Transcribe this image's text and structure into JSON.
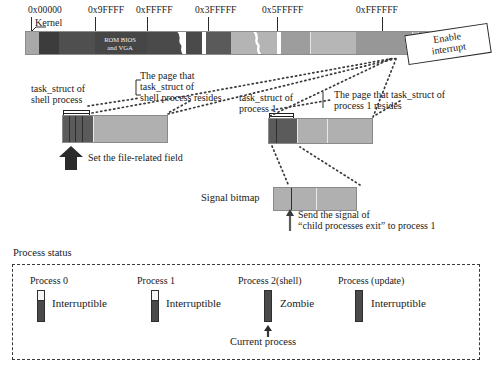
{
  "diagram": {
    "title_process_status": "Process status",
    "memory_map": {
      "addresses": [
        "0x00000",
        "0x9FFFF",
        "0xFFFFF",
        "0x3FFFFF",
        "0x5FFFFF",
        "0xFFFFFF"
      ],
      "kernel_label": "Kernel",
      "rom_label_line1": "ROM BIOS",
      "rom_label_line2": "and VGA"
    },
    "callout": {
      "enable_interrupt_line1": "Enable",
      "enable_interrupt_line2": "interrupt"
    },
    "shell": {
      "task_struct_line1": "task_struct of",
      "task_struct_line2": "shell process",
      "page_line1": "The page that",
      "page_line2": "task_struct of",
      "page_line3": "shell process resides",
      "action": "Set the file-related field"
    },
    "process1": {
      "task_struct_line1": "task_struct of",
      "task_struct_line2": "process 1",
      "page_line1": "The page that task_struct of",
      "page_line2": "process 1 resides"
    },
    "signal": {
      "bitmap_label": "Signal bitmap",
      "action_line1": "Send the signal of",
      "action_line2": "“child processes exit” to process 1"
    },
    "processes": [
      {
        "name": "Process 0",
        "state": "Interruptible",
        "bar": "partial"
      },
      {
        "name": "Process 1",
        "state": "Interruptible",
        "bar": "partial"
      },
      {
        "name": "Process 2(shell)",
        "state": "Zombie",
        "bar": "full",
        "note": "Current process"
      },
      {
        "name": "Process (update)",
        "state": "Interruptible",
        "bar": "full"
      }
    ],
    "colors": {
      "bar_light": "#b9b9b9",
      "bar_mid": "#9a9a9a",
      "bar_dark": "#4f4f4f",
      "bar_darker": "#3c3c3c",
      "outline": "#2b2b2b",
      "page_fill": "#b0b0b0",
      "page_dark": "#5b5b5b",
      "dashed_border": "#3a3a3a"
    }
  }
}
